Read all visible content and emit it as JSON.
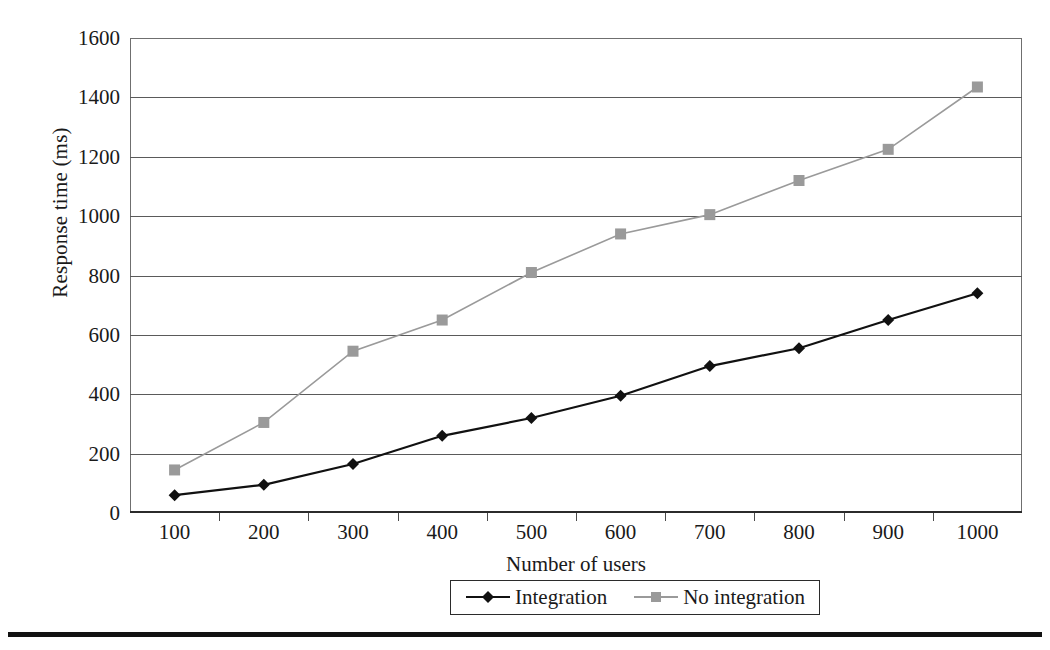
{
  "chart_data": {
    "type": "line",
    "title": "",
    "xlabel": "Number of users",
    "ylabel": "Response time (ms)",
    "categories": [
      100,
      200,
      300,
      400,
      500,
      600,
      700,
      800,
      900,
      1000
    ],
    "xtick_labels": [
      "100",
      "200",
      "300",
      "400",
      "500",
      "600",
      "700",
      "800",
      "900",
      "1000"
    ],
    "ytick_labels": [
      "0",
      "200",
      "400",
      "600",
      "800",
      "1000",
      "1200",
      "1400",
      "1600"
    ],
    "yticks": [
      0,
      200,
      400,
      600,
      800,
      1000,
      1200,
      1400,
      1600
    ],
    "ylim": [
      0,
      1600
    ],
    "grid": "horizontal",
    "legend_position": "bottom-center",
    "series": [
      {
        "name": "Integration",
        "marker": "diamond",
        "color": "#111111",
        "values": [
          60,
          95,
          165,
          260,
          320,
          395,
          495,
          555,
          650,
          740
        ]
      },
      {
        "name": "No integration",
        "marker": "square",
        "color": "#9a9a9a",
        "values": [
          145,
          305,
          545,
          650,
          810,
          940,
          1005,
          1120,
          1225,
          1435
        ]
      }
    ]
  },
  "legend": {
    "items": [
      {
        "label": "Integration",
        "marker": "diamond-marker",
        "color": "#111111"
      },
      {
        "label": "No integration",
        "marker": "square-marker",
        "color": "#9a9a9a"
      }
    ]
  },
  "axes": {
    "x_title": "Number of users",
    "y_title": "Response time (ms)"
  }
}
